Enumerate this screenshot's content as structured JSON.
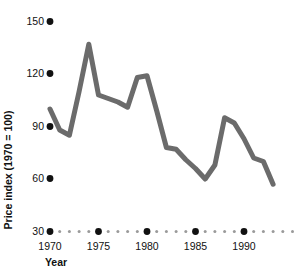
{
  "chart_data": {
    "type": "line",
    "title": "",
    "xlabel": "Year",
    "ylabel": "Price index (1970 = 100)",
    "xlim": [
      1970,
      1993
    ],
    "ylim": [
      30,
      150
    ],
    "grid": false,
    "legend": "none",
    "line_color": "#6b6b6b",
    "marker_color": "#111111",
    "minor_dot_color": "#9a9a9a",
    "x_ticks": [
      "1970",
      "1975",
      "1980",
      "1985",
      "1990"
    ],
    "x_tick_values": [
      1970,
      1975,
      1980,
      1985,
      1990
    ],
    "y_ticks": [
      "150",
      "120",
      "90",
      "60",
      "30"
    ],
    "y_tick_values": [
      150,
      120,
      90,
      60,
      30
    ],
    "x": [
      1970,
      1971,
      1972,
      1973,
      1974,
      1975,
      1976,
      1977,
      1978,
      1979,
      1980,
      1981,
      1982,
      1983,
      1984,
      1985,
      1986,
      1987,
      1988,
      1989,
      1990,
      1991,
      1992,
      1993
    ],
    "values": [
      100,
      88,
      85,
      110,
      137,
      108,
      106,
      104,
      101,
      118,
      119,
      99,
      78,
      77,
      71,
      66,
      60,
      68,
      95,
      92,
      83,
      72,
      70,
      57
    ],
    "series": [
      {
        "name": "Price index",
        "values": [
          100,
          88,
          85,
          110,
          137,
          108,
          106,
          104,
          101,
          118,
          119,
          99,
          78,
          77,
          71,
          66,
          60,
          68,
          95,
          92,
          83,
          72,
          70,
          57
        ]
      }
    ]
  },
  "axes": {
    "y_axis_title": "Price index (1970 = 100)",
    "x_axis_title": "Year"
  }
}
